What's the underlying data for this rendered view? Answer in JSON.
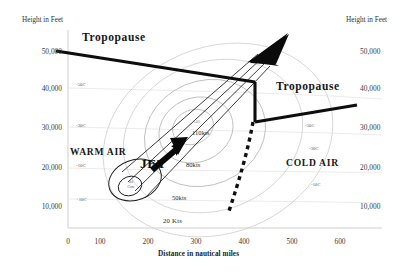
{
  "figure": {
    "type": "diagram",
    "background_color": "#ffffff",
    "ink_color": "#111111"
  },
  "axes": {
    "y_left_title": "Height in Feet",
    "y_right_title": "Height in Feet",
    "x_caption": "Distance in nautical miles",
    "y_ticks": [
      "50,000",
      "40,000",
      "30,000",
      "20,000",
      "10,000"
    ],
    "x_ticks": [
      "0",
      "100",
      "200",
      "300",
      "400",
      "500",
      "600"
    ],
    "y_unit": "feet",
    "x_unit": "nautical miles",
    "y_range": [
      0,
      55000
    ],
    "x_range": [
      0,
      650
    ]
  },
  "labels": {
    "tropopause_left": "Tropopause",
    "tropopause_right": "Tropopause",
    "warm_air": "WARM AIR",
    "cold_air": "COLD AIR",
    "jet": "JET",
    "jet_core_line1": "Jet",
    "jet_core_line2": "Core"
  },
  "temperatures_warm_side": [
    {
      "value": "-50C",
      "x_nm": 60,
      "height_ft": 42000
    },
    {
      "value": "-30C",
      "x_nm": 60,
      "height_ft": 30000
    },
    {
      "value": "-10C",
      "x_nm": 60,
      "height_ft": 19500
    },
    {
      "value": "+10C",
      "x_nm": 62,
      "height_ft": 9500
    }
  ],
  "temperatures_cold_side": [
    {
      "value": "-50C",
      "x_nm": 545,
      "height_ft": 30000
    },
    {
      "value": "-30C",
      "x_nm": 548,
      "height_ft": 22500
    },
    {
      "value": "-10C",
      "x_nm": 548,
      "height_ft": 12500
    }
  ],
  "isotachs": [
    {
      "label": "20 Kts",
      "speed_kts": 20
    },
    {
      "label": "50kts",
      "speed_kts": 50
    },
    {
      "label": "80kts",
      "speed_kts": 80
    },
    {
      "label": "110kts",
      "speed_kts": 110
    },
    {
      "label": "140",
      "speed_kts": 140
    }
  ],
  "features": {
    "front_boundary_style": "dashed",
    "jet_arrow_direction": "up-right",
    "tropopause_break_x_nm": 465,
    "tropopause_upper_left_ft": 50000,
    "tropopause_upper_break_ft": 41000,
    "tropopause_lower_break_ft": 30000,
    "tropopause_right_end_ft": 35000
  }
}
